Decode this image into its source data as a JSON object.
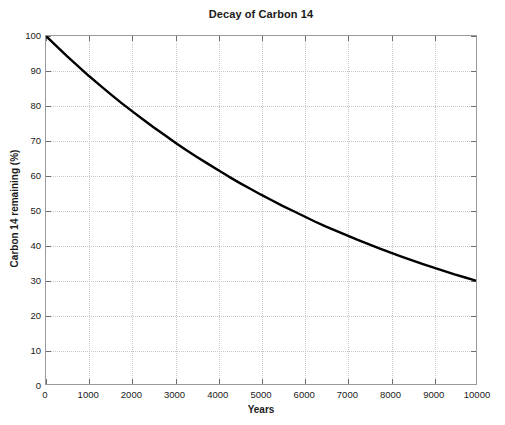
{
  "chart_data": {
    "type": "line",
    "title": "Decay of Carbon 14",
    "xlabel": "Years",
    "ylabel": "Carbon 14 remaining (%)",
    "xlim": [
      0,
      10000
    ],
    "ylim": [
      0,
      100
    ],
    "grid": true,
    "legend": "none",
    "line_color": "#000000",
    "line_width_px": 2.4,
    "x_ticks": [
      0,
      1000,
      2000,
      3000,
      4000,
      5000,
      6000,
      7000,
      8000,
      9000,
      10000
    ],
    "y_ticks": [
      0,
      10,
      20,
      30,
      40,
      50,
      60,
      70,
      80,
      90,
      100
    ],
    "x_tick_labels": [
      "0",
      "1000",
      "2000",
      "3000",
      "4000",
      "5000",
      "6000",
      "7000",
      "8000",
      "9000",
      "10000"
    ],
    "y_tick_labels": [
      "0",
      "10",
      "20",
      "30",
      "40",
      "50",
      "60",
      "70",
      "80",
      "90",
      "100"
    ],
    "series": [
      {
        "name": "Carbon 14 remaining",
        "x": [
          0,
          250,
          500,
          750,
          1000,
          1250,
          1500,
          1750,
          2000,
          2250,
          2500,
          2750,
          3000,
          3250,
          3500,
          3750,
          4000,
          4250,
          4500,
          4750,
          5000,
          5250,
          5500,
          5750,
          6000,
          6250,
          6500,
          6750,
          7000,
          7250,
          7500,
          7750,
          8000,
          8250,
          8500,
          8750,
          9000,
          9250,
          9500,
          9750,
          10000
        ],
        "y": [
          100.0,
          97.0,
          94.1,
          91.3,
          88.5,
          85.9,
          83.3,
          80.8,
          78.4,
          76.1,
          73.8,
          71.6,
          69.4,
          67.3,
          65.3,
          63.4,
          61.5,
          59.6,
          57.8,
          56.1,
          54.4,
          52.8,
          51.2,
          49.7,
          48.2,
          46.7,
          45.3,
          44.0,
          42.7,
          41.4,
          40.2,
          39.0,
          37.8,
          36.7,
          35.6,
          34.5,
          33.5,
          32.5,
          31.5,
          30.6,
          29.7
        ]
      }
    ]
  },
  "axes": {
    "x_title": "Years",
    "y_title": "Carbon 14 remaining (%)"
  },
  "title": "Decay of Carbon 14"
}
